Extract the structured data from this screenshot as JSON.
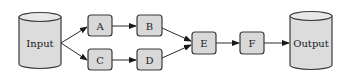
{
  "diagram": {
    "type": "flow",
    "nodes": [
      {
        "id": "input",
        "label": "Input",
        "shape": "cylinder"
      },
      {
        "id": "A",
        "label": "A",
        "shape": "rounded-box"
      },
      {
        "id": "B",
        "label": "B",
        "shape": "rounded-box"
      },
      {
        "id": "C",
        "label": "C",
        "shape": "rounded-box"
      },
      {
        "id": "D",
        "label": "D",
        "shape": "rounded-box"
      },
      {
        "id": "E",
        "label": "E",
        "shape": "rounded-box"
      },
      {
        "id": "F",
        "label": "F",
        "shape": "rounded-box"
      },
      {
        "id": "output",
        "label": "Output",
        "shape": "cylinder"
      }
    ],
    "edges": [
      {
        "from": "input",
        "to": "A"
      },
      {
        "from": "input",
        "to": "C"
      },
      {
        "from": "A",
        "to": "B"
      },
      {
        "from": "C",
        "to": "D"
      },
      {
        "from": "B",
        "to": "E"
      },
      {
        "from": "D",
        "to": "E"
      },
      {
        "from": "E",
        "to": "F"
      },
      {
        "from": "F",
        "to": "output"
      }
    ],
    "colors": {
      "node_fill": "#d9d9d9",
      "stroke": "#3a3a3a",
      "background": "#ffffff"
    }
  }
}
